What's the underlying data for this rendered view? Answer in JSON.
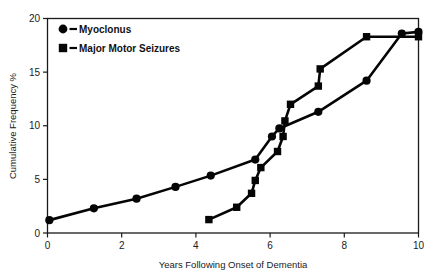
{
  "chart_data": {
    "type": "line",
    "title": "",
    "subtitle": "",
    "xlabel": "Years Following Onset of Dementia",
    "ylabel": "Cumulative Frequency %",
    "xlim": [
      0,
      10
    ],
    "ylim": [
      0,
      20
    ],
    "xticks": [
      0,
      2,
      4,
      6,
      8,
      10
    ],
    "yticks": [
      0,
      5,
      10,
      15,
      20
    ],
    "xticklabels": [
      "0",
      "2",
      "4",
      "6",
      "8",
      "10"
    ],
    "yticklabels": [
      "0",
      "5",
      "10",
      "15",
      "20"
    ],
    "grid": false,
    "legend_position": "upper left",
    "series": [
      {
        "name": "Myoclonus",
        "marker": "circle",
        "color": "#050505",
        "points": [
          [
            0.05,
            1.2
          ],
          [
            1.25,
            2.3
          ],
          [
            2.4,
            3.2
          ],
          [
            3.45,
            4.3
          ],
          [
            4.4,
            5.35
          ],
          [
            5.6,
            6.85
          ],
          [
            6.05,
            9.0
          ],
          [
            6.25,
            9.75
          ],
          [
            7.3,
            11.3
          ],
          [
            8.6,
            14.2
          ],
          [
            9.55,
            18.6
          ],
          [
            10.0,
            18.75
          ]
        ]
      },
      {
        "name": "Major Motor Seizures",
        "marker": "square",
        "color": "#050505",
        "points": [
          [
            4.35,
            1.25
          ],
          [
            5.1,
            2.4
          ],
          [
            5.5,
            3.7
          ],
          [
            5.6,
            4.9
          ],
          [
            5.75,
            6.1
          ],
          [
            6.2,
            7.6
          ],
          [
            6.35,
            9.0
          ],
          [
            6.4,
            10.45
          ],
          [
            6.55,
            12.0
          ],
          [
            7.3,
            13.7
          ],
          [
            7.35,
            15.3
          ],
          [
            8.6,
            18.3
          ],
          [
            10.0,
            18.3
          ]
        ]
      }
    ]
  },
  "legend": {
    "items": [
      {
        "label": "Myoclonus",
        "marker": "circle"
      },
      {
        "label": "Major Motor Seizures",
        "marker": "square"
      }
    ]
  },
  "axes": {
    "x_title": "Years Following Onset of Dementia",
    "y_title": "Cumulative Frequency %"
  }
}
